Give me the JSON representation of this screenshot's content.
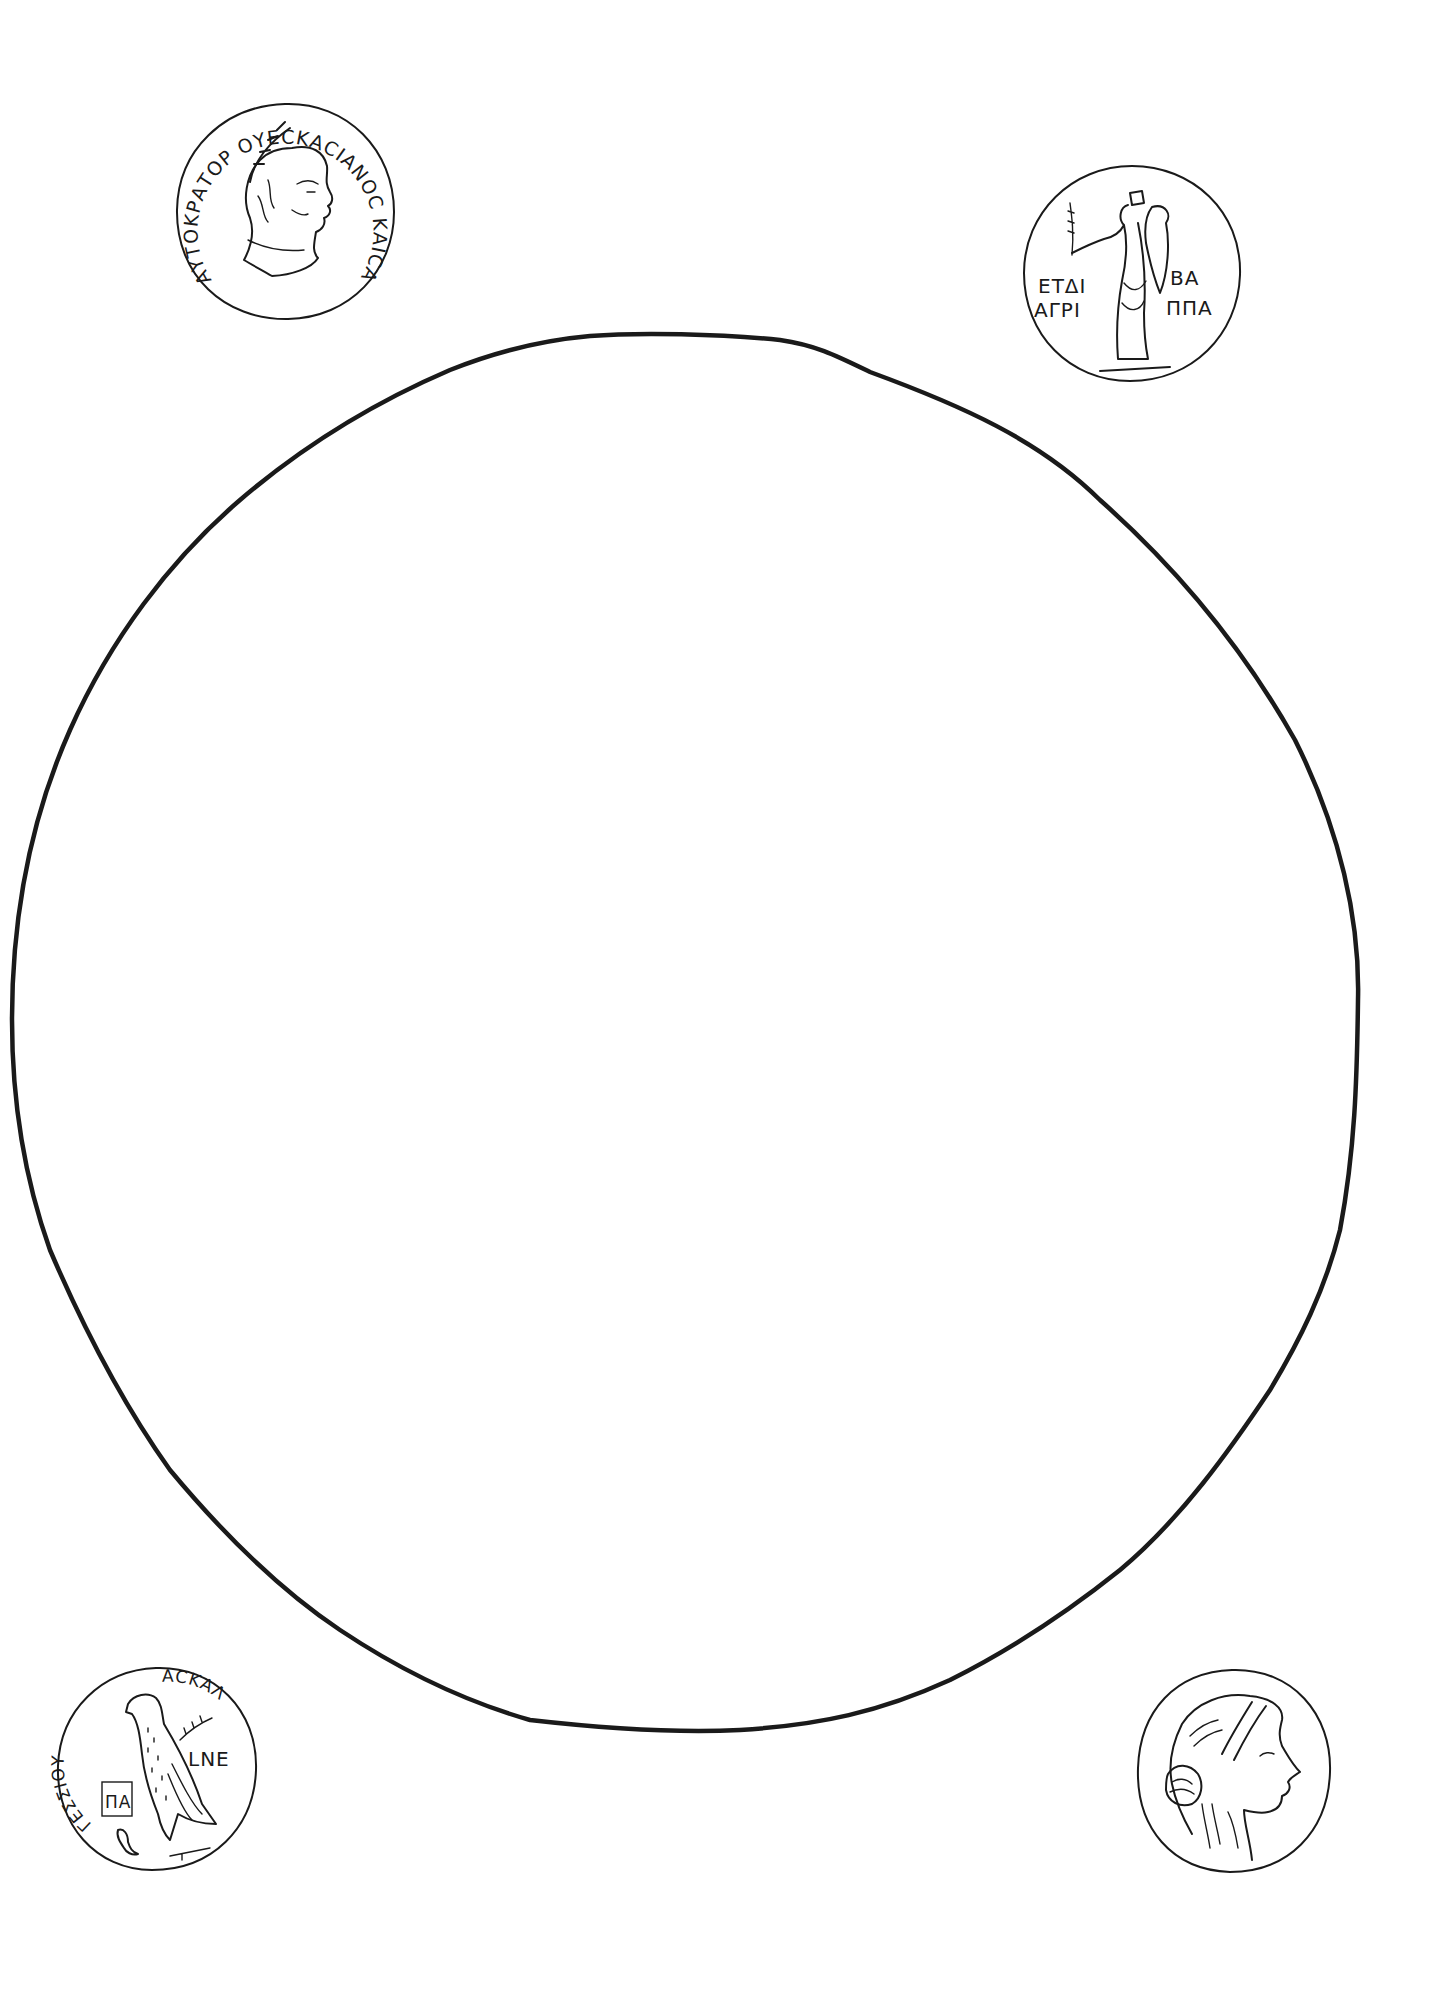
{
  "page": {
    "line_color": "#1a1a1a",
    "background": "#ffffff"
  },
  "frame": {
    "shape": "circle",
    "label": "empty-drawing-area"
  },
  "coins": [
    {
      "position": "top-left",
      "subject": "laureate emperor bust facing right",
      "inscription": "ΑΥΤΟΚΡΑΤΟΡ ΟΥΕCΚΑCΙΑΝΟC ΚΑΙCΑΡ CΕΒΑCΤΟC",
      "inscription_visible_start": "ΑΥΤΟΚΡΑΟΥΕ",
      "inscription_visible_end": "ΚΑΙCΑΡ CΕΒΑCΤΟC"
    },
    {
      "position": "top-right",
      "subject": "standing Tyche with cornucopia and palm branch",
      "legend_lines": {
        "left_top": "ΕΤΔΙ",
        "right_top": "ΒΑ",
        "left_bottom": "ΑΓΡΙ",
        "right_bottom": "ΠΠΑ"
      }
    },
    {
      "position": "bottom-left",
      "subject": "eagle with palm branch and small bird",
      "inscription_left": "ΓΕΣΣΙΟΥ",
      "inscription_right": "ΑСΚΑΛ",
      "field_right": "LNΕ",
      "monogram": "ΠΑ"
    },
    {
      "position": "bottom-right",
      "subject": "female head with sakkos facing right",
      "inscription": ""
    }
  ]
}
